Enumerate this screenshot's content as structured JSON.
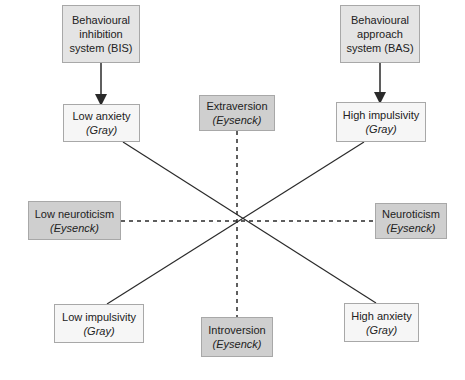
{
  "diagram": {
    "type": "personality-dimensions-comparison",
    "colors": {
      "line": "#2a2a2a",
      "system_box_fill": "#e4e4e4",
      "gray_box_fill": "#f6f6f6",
      "eysenck_box_fill": "#cfcfcf",
      "box_border": "#a8a8a8"
    },
    "systems": {
      "bis": {
        "line1": "Behavioural",
        "line2": "inhibition",
        "line3": "system (BIS)"
      },
      "bas": {
        "line1": "Behavioural",
        "line2": "approach",
        "line3": "system (BAS)"
      }
    },
    "gray_nodes": {
      "low_anxiety": {
        "label": "Low anxiety",
        "source": "(Gray)"
      },
      "high_impulsivity": {
        "label": "High impulsivity",
        "source": "(Gray)"
      },
      "low_impulsivity": {
        "label": "Low impulsivity",
        "source": "(Gray)"
      },
      "high_anxiety": {
        "label": "High anxiety",
        "source": "(Gray)"
      }
    },
    "eysenck_nodes": {
      "extraversion": {
        "label": "Extraversion",
        "source": "(Eysenck)"
      },
      "introversion": {
        "label": "Introversion",
        "source": "(Eysenck)"
      },
      "low_neuroticism": {
        "label": "Low neuroticism",
        "source": "(Eysenck)"
      },
      "neuroticism": {
        "label": "Neuroticism",
        "source": "(Eysenck)"
      }
    },
    "edges": [
      {
        "from": "BIS",
        "to": "Low anxiety",
        "style": "arrow"
      },
      {
        "from": "BAS",
        "to": "High impulsivity",
        "style": "arrow"
      },
      {
        "from": "Low anxiety",
        "to": "High anxiety",
        "style": "solid"
      },
      {
        "from": "High impulsivity",
        "to": "Low impulsivity",
        "style": "solid"
      },
      {
        "from": "Extraversion",
        "to": "Introversion",
        "style": "dashed"
      },
      {
        "from": "Low neuroticism",
        "to": "Neuroticism",
        "style": "dashed"
      }
    ]
  }
}
